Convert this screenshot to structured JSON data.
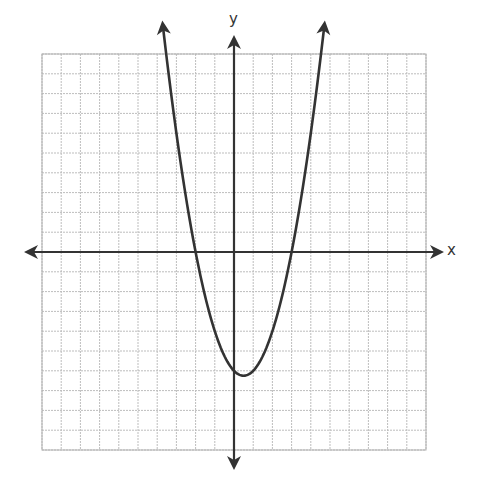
{
  "chart_data": {
    "type": "line",
    "title": "",
    "xlabel": "x",
    "ylabel": "y",
    "xlim": [
      -10,
      10
    ],
    "ylim": [
      -10,
      10
    ],
    "grid": true,
    "grid_step": 1,
    "tick_labels": false,
    "legend": null,
    "series": [
      {
        "name": "parabola",
        "equation": "y = x^2 - x - 6",
        "vertex": [
          0.5,
          -6.25
        ],
        "x_intercepts": [
          -2,
          3
        ],
        "y_intercept": -6,
        "opens": "up",
        "arrows_on_ends": true,
        "x": [
          -3.7,
          -3.5,
          -3,
          -2.5,
          -2,
          -1.5,
          -1,
          -0.5,
          0,
          0.5,
          1,
          1.5,
          2,
          2.5,
          3,
          3.5,
          4,
          4.5,
          4.7
        ],
        "values": [
          11.39,
          9.75,
          6,
          2.75,
          0,
          -2.25,
          -4,
          -5.25,
          -6,
          -6.25,
          -6,
          -5.25,
          -4,
          -2.75,
          0,
          2.75,
          6,
          9.75,
          11.39
        ]
      }
    ]
  },
  "axes": {
    "x_label": "x",
    "y_label": "y"
  },
  "colors": {
    "grid": "#bdbdbd",
    "grid_border": "#b0b0b0",
    "axis": "#333333",
    "curve": "#333333",
    "background": "#ffffff"
  }
}
